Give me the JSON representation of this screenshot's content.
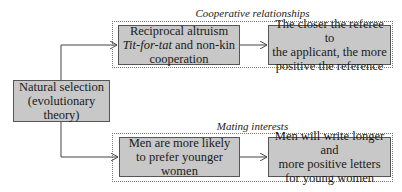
{
  "root": {
    "line1": "Natural selection",
    "line2": "(evolutionary theory)"
  },
  "groups": [
    {
      "label": "Cooperative relationships",
      "boxes": [
        {
          "line1": "Reciprocal altruism",
          "line2_italic": "Tit-for-tat",
          "line2_rest": " and non-kin",
          "line3": "cooperation"
        },
        {
          "line1": "The closer the referee to",
          "line2": "the applicant, the more",
          "line3": "positive the reference"
        }
      ]
    },
    {
      "label": "Mating interests",
      "boxes": [
        {
          "line1": "Men are more likely",
          "line2": "to prefer younger women"
        },
        {
          "line1": "Men will write longer and",
          "line2": "more positive letters",
          "line3": "for young women"
        }
      ]
    }
  ],
  "colors": {
    "box_fill": "#c8c8c8",
    "box_border": "#555555",
    "line": "#444444"
  }
}
